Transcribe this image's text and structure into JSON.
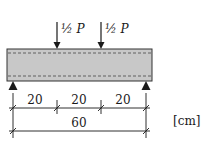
{
  "diagram": {
    "loads": [
      {
        "label": "½ P",
        "position_cm": 20
      },
      {
        "label": "½ P",
        "position_cm": 40
      }
    ],
    "dimensions": {
      "segments": [
        "20",
        "20",
        "20"
      ],
      "total": "60",
      "unit": "[cm]"
    },
    "supports": [
      "left-pin",
      "right-pin"
    ],
    "colors": {
      "beam_fill": "#c8c8c8",
      "beam_stroke": "#333333",
      "line": "#1a1a1a",
      "rebar_dash": "#555555"
    }
  }
}
